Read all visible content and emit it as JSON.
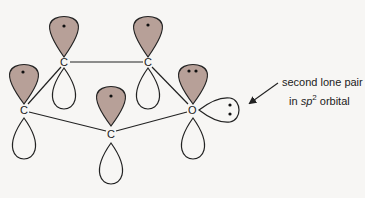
{
  "diagram": {
    "colors": {
      "filled_lobe": "#b7a098",
      "outline": "#222222",
      "background": "#f7f6f4"
    },
    "atoms": [
      {
        "id": "c1",
        "symbol": "C",
        "p_electrons": 1
      },
      {
        "id": "c2",
        "symbol": "C",
        "p_electrons": 1
      },
      {
        "id": "c3",
        "symbol": "C",
        "p_electrons": 1
      },
      {
        "id": "c4",
        "symbol": "C",
        "p_electrons": 1
      },
      {
        "id": "o",
        "symbol": "O",
        "p_electrons": 2,
        "sp2_lone_pair_electrons": 2
      }
    ],
    "annotation": {
      "line1": "second lone pair",
      "line2_prefix": "in ",
      "line2_italic": "sp",
      "line2_sup": "2",
      "line2_suffix": " orbital"
    }
  }
}
